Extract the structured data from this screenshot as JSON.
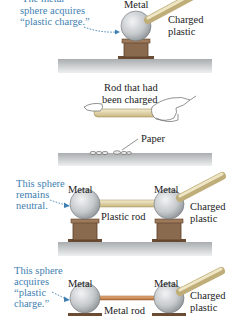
{
  "colors": {
    "annotation_blue": "#3f7fb2",
    "sphere": "#c9cdd0",
    "stand": "#8a6a4e",
    "plastic_rod": "#e3d5a6",
    "metal_rod": "#c8874e",
    "table": "#c8cbcc"
  },
  "panels": [
    {
      "id": "panel-1",
      "annotation": [
        "The metal",
        "sphere acquires",
        "“plastic charge.”"
      ],
      "sphere_label": "Metal",
      "rod_label": [
        "Charged",
        "plastic"
      ]
    },
    {
      "id": "panel-2",
      "rod_label": [
        "Rod that had",
        "been charged"
      ],
      "paper_label": "Paper"
    },
    {
      "id": "panel-3",
      "annotation": [
        "This sphere",
        "remains",
        "neutral."
      ],
      "left_sphere_label": "Metal",
      "right_sphere_label": "Metal",
      "connector_label": "Plastic rod",
      "rod_label": [
        "Charged",
        "plastic"
      ]
    },
    {
      "id": "panel-4",
      "annotation": [
        "This sphere",
        "acquires",
        "“plastic",
        "charge.”"
      ],
      "left_sphere_label": "Metal",
      "right_sphere_label": "Metal",
      "connector_label": "Metal rod",
      "rod_label": [
        "Charged",
        "plastic"
      ]
    }
  ]
}
